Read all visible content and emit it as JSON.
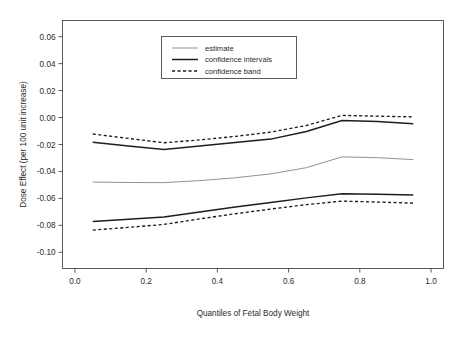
{
  "chart_data": {
    "type": "line",
    "title": "",
    "xlabel": "Quantiles of Fetal Body Weight",
    "ylabel": "Dose Effect (per 100 unit increase)",
    "xlim": [
      -0.035,
      1.035
    ],
    "ylim": [
      -0.112,
      0.072
    ],
    "grid": false,
    "legend_position": "upper-center",
    "xticks": [
      "0.0",
      "0.2",
      "0.4",
      "0.6",
      "0.8",
      "1.0"
    ],
    "xtick_values": [
      0.0,
      0.2,
      0.4,
      0.6,
      0.8,
      1.0
    ],
    "yticks": [
      "0.06",
      "0.04",
      "0.02",
      "0.00",
      "-0.02",
      "-0.04",
      "-0.06",
      "-0.08",
      "-0.10"
    ],
    "ytick_values": [
      0.06,
      0.04,
      0.02,
      0.0,
      -0.02,
      -0.04,
      -0.06,
      -0.08,
      -0.1
    ],
    "x": [
      0.05,
      0.15,
      0.25,
      0.35,
      0.45,
      0.55,
      0.65,
      0.75,
      0.85,
      0.95
    ],
    "series": [
      {
        "name": "confidence band",
        "role": "upper-band",
        "style": "dashed",
        "values": [
          -0.0122,
          -0.0155,
          -0.0187,
          -0.0166,
          -0.014,
          -0.0108,
          -0.0059,
          0.0016,
          0.001,
          0.0005
        ]
      },
      {
        "name": "confidence intervals",
        "role": "upper-ci",
        "style": "solid-thick",
        "values": [
          -0.0183,
          -0.0212,
          -0.0237,
          -0.0212,
          -0.0186,
          -0.016,
          -0.0104,
          -0.0022,
          -0.003,
          -0.0046
        ]
      },
      {
        "name": "estimate",
        "role": "estimate",
        "style": "thin",
        "values": [
          -0.0479,
          -0.0482,
          -0.0483,
          -0.0468,
          -0.0447,
          -0.0418,
          -0.0372,
          -0.0292,
          -0.0298,
          -0.0312
        ]
      },
      {
        "name": "confidence intervals",
        "role": "lower-ci",
        "style": "solid-thick",
        "values": [
          -0.0772,
          -0.0755,
          -0.0738,
          -0.07,
          -0.0664,
          -0.063,
          -0.0596,
          -0.0566,
          -0.057,
          -0.0575
        ]
      },
      {
        "name": "confidence band",
        "role": "lower-band",
        "style": "dashed",
        "values": [
          -0.0835,
          -0.0815,
          -0.0793,
          -0.0752,
          -0.0714,
          -0.0679,
          -0.0646,
          -0.062,
          -0.0627,
          -0.0635
        ]
      }
    ],
    "legend": [
      {
        "label": "estimate",
        "style": "thin"
      },
      {
        "label": "confidence intervals",
        "style": "solid-thick"
      },
      {
        "label": "confidence band",
        "style": "dashed"
      }
    ]
  }
}
